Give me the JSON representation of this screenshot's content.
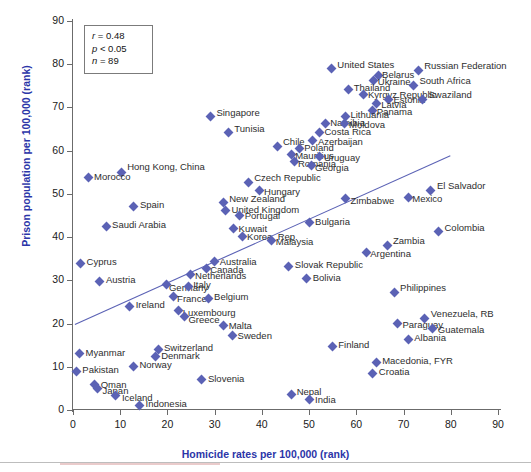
{
  "figure": {
    "background": "#ffffff",
    "marker_color": "#5b62b5",
    "axis_color": "#6b6b6b",
    "label_color": "#2b35a8",
    "trendline_color": "#5b62b5"
  },
  "stats_box": {
    "r_label": "r",
    "r_value": "= 0.48",
    "p_label": "p",
    "p_value": "< 0.05",
    "n_label": "n",
    "n_value": "= 89"
  },
  "chart_data": {
    "type": "scatter",
    "title": "",
    "xlabel": "Homicide rates per 100,000 (rank)",
    "ylabel": "Prison population per 100,000 (rank)",
    "xlim": [
      0,
      90
    ],
    "ylim": [
      0,
      90
    ],
    "xticks": [
      0,
      10,
      20,
      30,
      40,
      50,
      60,
      70,
      80,
      90
    ],
    "yticks": [
      0,
      10,
      20,
      30,
      40,
      50,
      60,
      70,
      80,
      90
    ],
    "grid": false,
    "legend": false,
    "annotations": [
      "r = 0.48",
      "p < 0.05",
      "n = 89"
    ],
    "trendline": {
      "x0": 0.4,
      "y0": 19.8,
      "x1": 79.9,
      "y1": 58.8
    },
    "points": [
      {
        "label": "United States",
        "x": 54.7,
        "y": 79.0,
        "lx": 6,
        "ly": -4
      },
      {
        "label": "Belarus",
        "x": 64.6,
        "y": 77.3,
        "lx": 4,
        "ly": -1
      },
      {
        "label": "Russian Federation",
        "x": 73.1,
        "y": 78.6,
        "lx": 6,
        "ly": -4
      },
      {
        "label": "Ukraine",
        "x": 63.7,
        "y": 76.2,
        "lx": 4,
        "ly": 1
      },
      {
        "label": "South Africa",
        "x": 72.1,
        "y": 75.1,
        "lx": 6,
        "ly": -4
      },
      {
        "label": "Thailand",
        "x": 58.4,
        "y": 74.2,
        "lx": 5,
        "ly": -1
      },
      {
        "label": "Kyrgyz Republic",
        "x": 61.6,
        "y": 73.1,
        "lx": 4,
        "ly": 1
      },
      {
        "label": "Estonia",
        "x": 66.8,
        "y": 71.9,
        "lx": 5,
        "ly": 1
      },
      {
        "label": "Swaziland",
        "x": 74.0,
        "y": 71.9,
        "lx": 6,
        "ly": -4
      },
      {
        "label": "Latvia",
        "x": 64.2,
        "y": 70.8,
        "lx": 5,
        "ly": 1
      },
      {
        "label": "Panama",
        "x": 63.5,
        "y": 69.4,
        "lx": 4,
        "ly": 2
      },
      {
        "label": "Lithuania",
        "x": 57.7,
        "y": 68.0,
        "lx": 5,
        "ly": -1
      },
      {
        "label": "Singapore",
        "x": 29.1,
        "y": 67.8,
        "lx": 6,
        "ly": -4
      },
      {
        "label": "Namibia",
        "x": 53.4,
        "y": 66.2,
        "lx": 5,
        "ly": -1
      },
      {
        "label": "Moldova",
        "x": 57.4,
        "y": 66.2,
        "lx": 5,
        "ly": 1
      },
      {
        "label": "Tunisia",
        "x": 32.9,
        "y": 64.1,
        "lx": 6,
        "ly": -4
      },
      {
        "label": "Costa Rica",
        "x": 52.2,
        "y": 64.2,
        "lx": 5,
        "ly": -1
      },
      {
        "label": "Azerbaijan",
        "x": 50.8,
        "y": 62.3,
        "lx": 5,
        "ly": 1
      },
      {
        "label": "Chile",
        "x": 43.2,
        "y": 61.0,
        "lx": 6,
        "ly": -4
      },
      {
        "label": "Poland",
        "x": 47.9,
        "y": 60.5,
        "lx": 5,
        "ly": -1
      },
      {
        "label": "Mauritius",
        "x": 46.2,
        "y": 59.0,
        "lx": 4,
        "ly": 1
      },
      {
        "label": "Uruguay",
        "x": 52.1,
        "y": 58.6,
        "lx": 5,
        "ly": 1
      },
      {
        "label": "Romania",
        "x": 46.8,
        "y": 57.4,
        "lx": 4,
        "ly": 2
      },
      {
        "label": "Georgia",
        "x": 50.4,
        "y": 56.6,
        "lx": 4,
        "ly": 3
      },
      {
        "label": "Hong Kong, China",
        "x": 10.2,
        "y": 55.0,
        "lx": 6,
        "ly": -5
      },
      {
        "label": "Morocco",
        "x": 3.2,
        "y": 53.7,
        "lx": 6,
        "ly": -1
      },
      {
        "label": "Czech Republic",
        "x": 37.1,
        "y": 52.7,
        "lx": 6,
        "ly": -4
      },
      {
        "label": "Hungary",
        "x": 39.4,
        "y": 50.7,
        "lx": 5,
        "ly": 1
      },
      {
        "label": "El Salvador",
        "x": 75.8,
        "y": 50.8,
        "lx": 6,
        "ly": -4
      },
      {
        "label": "Mexico",
        "x": 71.0,
        "y": 49.2,
        "lx": 4,
        "ly": 2
      },
      {
        "label": "Zimbabwe",
        "x": 57.7,
        "y": 48.9,
        "lx": 5,
        "ly": 2
      },
      {
        "label": "New Zealand",
        "x": 31.8,
        "y": 48.0,
        "lx": 6,
        "ly": -4
      },
      {
        "label": "Spain",
        "x": 12.9,
        "y": 47.1,
        "lx": 6,
        "ly": -1
      },
      {
        "label": "United Kingdom",
        "x": 32.3,
        "y": 46.1,
        "lx": 6,
        "ly": -1
      },
      {
        "label": "Portugal",
        "x": 35.3,
        "y": 45.1,
        "lx": 5,
        "ly": 1
      },
      {
        "label": "Saudi Arabia",
        "x": 7.0,
        "y": 42.5,
        "lx": 6,
        "ly": -1
      },
      {
        "label": "Bulgaria",
        "x": 50.0,
        "y": 43.3,
        "lx": 6,
        "ly": -1
      },
      {
        "label": "Kuwait",
        "x": 34.0,
        "y": 42.0,
        "lx": 5,
        "ly": 1
      },
      {
        "label": "Colombia",
        "x": 77.4,
        "y": 41.2,
        "lx": 6,
        "ly": -4
      },
      {
        "label": "Korea, Rep.",
        "x": 35.8,
        "y": 40.2,
        "lx": 5,
        "ly": 1
      },
      {
        "label": "Malaysia",
        "x": 42.1,
        "y": 39.3,
        "lx": 4,
        "ly": 2
      },
      {
        "label": "Zambia",
        "x": 66.5,
        "y": 38.1,
        "lx": 6,
        "ly": -4
      },
      {
        "label": "Argentina",
        "x": 62.1,
        "y": 36.4,
        "lx": 4,
        "ly": 1
      },
      {
        "label": "Cyprus",
        "x": 1.6,
        "y": 34.0,
        "lx": 6,
        "ly": -1
      },
      {
        "label": "Australia",
        "x": 30.0,
        "y": 34.4,
        "lx": 5,
        "ly": 1
      },
      {
        "label": "Canada",
        "x": 28.2,
        "y": 32.8,
        "lx": 4,
        "ly": 2
      },
      {
        "label": "Slovak Republic",
        "x": 45.7,
        "y": 33.3,
        "lx": 6,
        "ly": -1
      },
      {
        "label": "Netherlands",
        "x": 24.8,
        "y": 31.4,
        "lx": 5,
        "ly": 2
      },
      {
        "label": "Bolivia",
        "x": 49.5,
        "y": 30.4,
        "lx": 6,
        "ly": -1
      },
      {
        "label": "Austria",
        "x": 5.7,
        "y": 29.8,
        "lx": 6,
        "ly": -1
      },
      {
        "label": "Germany",
        "x": 19.9,
        "y": 29.0,
        "lx": 2,
        "ly": 3
      },
      {
        "label": "Italy",
        "x": 24.4,
        "y": 28.6,
        "lx": 5,
        "ly": -1
      },
      {
        "label": "Philippines",
        "x": 68.0,
        "y": 27.2,
        "lx": 6,
        "ly": -4
      },
      {
        "label": "France",
        "x": 21.2,
        "y": 26.2,
        "lx": 4,
        "ly": 2
      },
      {
        "label": "Belgium",
        "x": 28.6,
        "y": 25.8,
        "lx": 6,
        "ly": -1
      },
      {
        "label": "Ireland",
        "x": 12.0,
        "y": 24.0,
        "lx": 6,
        "ly": -1
      },
      {
        "label": "Luxembourg",
        "x": 22.4,
        "y": 23.0,
        "lx": 4,
        "ly": 2
      },
      {
        "label": "Greece",
        "x": 23.6,
        "y": 21.6,
        "lx": 4,
        "ly": 3
      },
      {
        "label": "Venezuela, RB",
        "x": 74.5,
        "y": 21.2,
        "lx": 6,
        "ly": -4
      },
      {
        "label": "Paraguay",
        "x": 68.7,
        "y": 20.0,
        "lx": 5,
        "ly": 1
      },
      {
        "label": "Malta",
        "x": 31.9,
        "y": 19.6,
        "lx": 5,
        "ly": 1
      },
      {
        "label": "Guatemala",
        "x": 76.2,
        "y": 18.8,
        "lx": 5,
        "ly": 1
      },
      {
        "label": "Sweden",
        "x": 33.8,
        "y": 17.3,
        "lx": 5,
        "ly": 1
      },
      {
        "label": "Albania",
        "x": 71.0,
        "y": 16.4,
        "lx": 6,
        "ly": -1
      },
      {
        "label": "Switzerland",
        "x": 18.0,
        "y": 14.0,
        "lx": 6,
        "ly": -1
      },
      {
        "label": "Finland",
        "x": 54.9,
        "y": 14.8,
        "lx": 6,
        "ly": -1
      },
      {
        "label": "Myanmar",
        "x": 1.4,
        "y": 13.0,
        "lx": 6,
        "ly": -1
      },
      {
        "label": "Denmark",
        "x": 17.4,
        "y": 12.4,
        "lx": 6,
        "ly": 0
      },
      {
        "label": "Macedonia, FYR",
        "x": 64.2,
        "y": 11.0,
        "lx": 6,
        "ly": -1
      },
      {
        "label": "Norway",
        "x": 12.8,
        "y": 10.1,
        "lx": 6,
        "ly": -1
      },
      {
        "label": "Pakistan",
        "x": 0.7,
        "y": 9.0,
        "lx": 6,
        "ly": -1
      },
      {
        "label": "Croatia",
        "x": 63.5,
        "y": 8.5,
        "lx": 6,
        "ly": -1
      },
      {
        "label": "Slovenia",
        "x": 27.3,
        "y": 7.0,
        "lx": 6,
        "ly": -1
      },
      {
        "label": "Oman",
        "x": 4.6,
        "y": 6.0,
        "lx": 6,
        "ly": 1
      },
      {
        "label": "Japan",
        "x": 5.2,
        "y": 5.0,
        "lx": 5,
        "ly": 3
      },
      {
        "label": "Nepal",
        "x": 46.3,
        "y": 3.5,
        "lx": 5,
        "ly": -3
      },
      {
        "label": "Iceland",
        "x": 9.1,
        "y": 3.4,
        "lx": 6,
        "ly": 3
      },
      {
        "label": "India",
        "x": 50.0,
        "y": 2.4,
        "lx": 6,
        "ly": 0
      },
      {
        "label": "Indonesia",
        "x": 14.1,
        "y": 1.1,
        "lx": 6,
        "ly": -1
      }
    ]
  }
}
